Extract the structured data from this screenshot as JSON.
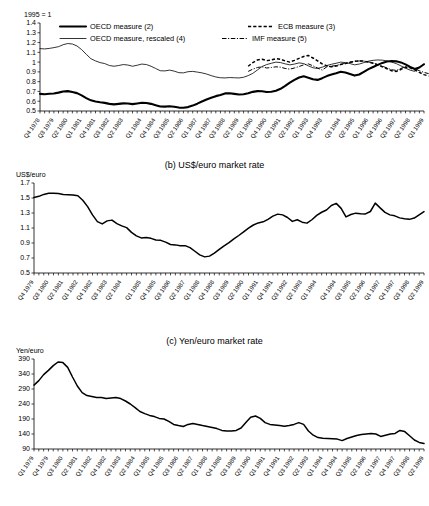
{
  "figure": {
    "panels": [
      {
        "id": "a",
        "title": "",
        "axis_unit": "1995 = 1"
      },
      {
        "id": "b",
        "title": "(b) US$/euro market rate",
        "axis_unit": "US$/euro"
      },
      {
        "id": "c",
        "title": "(c) Yen/euro market rate",
        "axis_unit": "Yen/euro"
      }
    ]
  },
  "chart_data": [
    {
      "panel": "a",
      "type": "line",
      "title": "",
      "xlabel": "",
      "ylabel": "1995 = 1",
      "ylim": [
        0.5,
        1.4
      ],
      "yticks": [
        "0.5",
        "0.6",
        "0.7",
        "0.8",
        "0.9",
        "1",
        "1.1",
        "1.2",
        "1.3",
        "1.4"
      ],
      "grid": false,
      "legend_position": "top",
      "legend": [
        {
          "label": "OECD measure (2)",
          "style": "thick-solid"
        },
        {
          "label": "ECB measure (3)",
          "style": "dashed"
        },
        {
          "label": "OECD measure, rescaled (4)",
          "style": "thin-solid"
        },
        {
          "label": "IMF measure (5)",
          "style": "dash-dot"
        }
      ],
      "x": [
        "Q4 1978",
        "Q1 1979",
        "Q2 1979",
        "Q3 1979",
        "Q4 1979",
        "Q1 1980",
        "Q2 1980",
        "Q3 1980",
        "Q4 1980",
        "Q1 1981",
        "Q2 1981",
        "Q3 1981",
        "Q4 1981",
        "Q1 1982",
        "Q2 1982",
        "Q3 1982",
        "Q4 1982",
        "Q1 1983",
        "Q2 1983",
        "Q3 1983",
        "Q4 1983",
        "Q1 1984",
        "Q2 1984",
        "Q3 1984",
        "Q4 1984",
        "Q1 1985",
        "Q2 1985",
        "Q3 1985",
        "Q4 1985",
        "Q1 1986",
        "Q2 1986",
        "Q3 1986",
        "Q4 1986",
        "Q1 1987",
        "Q2 1987",
        "Q3 1987",
        "Q4 1987",
        "Q1 1988",
        "Q2 1988",
        "Q3 1988",
        "Q4 1988",
        "Q1 1989",
        "Q2 1989",
        "Q3 1989",
        "Q4 1989",
        "Q1 1990",
        "Q2 1990",
        "Q3 1990",
        "Q4 1990",
        "Q1 1991",
        "Q2 1991",
        "Q3 1991",
        "Q4 1991",
        "Q1 1992",
        "Q2 1992",
        "Q3 1992",
        "Q4 1992",
        "Q1 1993",
        "Q2 1993",
        "Q3 1993",
        "Q4 1993",
        "Q1 1994",
        "Q2 1994",
        "Q3 1994",
        "Q4 1994",
        "Q1 1995",
        "Q2 1995",
        "Q3 1995",
        "Q4 1995",
        "Q1 1996",
        "Q2 1996",
        "Q3 1996",
        "Q4 1996",
        "Q1 1997",
        "Q2 1997",
        "Q3 1997",
        "Q4 1997",
        "Q1 1998",
        "Q2 1998",
        "Q3 1998",
        "Q4 1998",
        "Q1 1999",
        "Q2 1999",
        "Q3 1999"
      ],
      "xtick_labels": [
        "Q4 1978",
        "Q3 1979",
        "Q2 1980",
        "Q1 1981",
        "Q4 1981",
        "Q3 1982",
        "Q2 1983",
        "Q1 1984",
        "Q4 1984",
        "Q3 1985",
        "Q2 1986",
        "Q1 1987",
        "Q4 1987",
        "Q3 1988",
        "Q2 1989",
        "Q1 1990",
        "Q4 1990",
        "Q3 1991",
        "Q2 1992",
        "Q1 1993",
        "Q4 1993",
        "Q3 1994",
        "Q2 1995",
        "Q1 1996",
        "Q4 1996",
        "Q3 1997",
        "Q2 1998",
        "Q1 1999"
      ],
      "series": [
        {
          "name": "OECD measure (2)",
          "style": "thick-solid",
          "values": [
            0.675,
            0.672,
            0.676,
            0.679,
            0.688,
            0.7,
            0.703,
            0.694,
            0.683,
            0.66,
            0.632,
            0.609,
            0.597,
            0.589,
            0.583,
            0.573,
            0.568,
            0.573,
            0.578,
            0.576,
            0.57,
            0.577,
            0.585,
            0.582,
            0.573,
            0.559,
            0.546,
            0.545,
            0.549,
            0.543,
            0.535,
            0.534,
            0.54,
            0.555,
            0.575,
            0.597,
            0.617,
            0.636,
            0.652,
            0.664,
            0.68,
            0.682,
            0.675,
            0.668,
            0.672,
            0.682,
            0.696,
            0.703,
            0.702,
            0.695,
            0.697,
            0.707,
            0.727,
            0.757,
            0.79,
            0.818,
            0.843,
            0.855,
            0.841,
            0.825,
            0.818,
            0.836,
            0.857,
            0.873,
            0.886,
            0.901,
            0.893,
            0.878,
            0.862,
            0.873,
            0.9,
            0.928,
            0.95,
            0.972,
            0.992,
            1.006,
            1.012,
            1.008,
            0.997,
            0.977,
            0.951,
            0.93,
            0.945,
            0.978
          ]
        },
        {
          "name": "OECD measure, rescaled (4)",
          "style": "thin-solid",
          "values": [
            1.135,
            1.133,
            1.138,
            1.144,
            1.152,
            1.17,
            1.186,
            1.182,
            1.16,
            1.122,
            1.08,
            1.042,
            1.02,
            1.004,
            0.993,
            0.975,
            0.967,
            0.973,
            0.982,
            0.978,
            0.966,
            0.978,
            0.99,
            0.985,
            0.969,
            0.946,
            0.925,
            0.924,
            0.93,
            0.92,
            0.906,
            0.904,
            0.915,
            0.94,
            0.973,
            1.01,
            1.043,
            1.076,
            1.103,
            1.123,
            1.15,
            1.154,
            1.142,
            1.13,
            1.137,
            1.153,
            1.177,
            1.189,
            1.188,
            1.176,
            1.18,
            1.197,
            1.23,
            1.281,
            1.337,
            1.385,
            1.427,
            1.447,
            1.423,
            1.396,
            1.385,
            1.415,
            1.45,
            1.478,
            1.5,
            1.525,
            1.511,
            1.486,
            1.459,
            1.478,
            1.524,
            1.571,
            1.608,
            1.645,
            1.679,
            1.703,
            1.713,
            1.706,
            1.688,
            1.654,
            1.61,
            1.574,
            1.599,
            1.655
          ],
          "y_display_note": "plotted on same axis as OECD measure but scaled so 1995 = 1; displayed between 0.80 and 1.20 over 1979-1999",
          "display_values": [
            1.138,
            1.135,
            1.14,
            1.148,
            1.158,
            1.178,
            1.19,
            1.185,
            1.165,
            1.128,
            1.08,
            1.035,
            1.012,
            0.995,
            0.985,
            0.965,
            0.958,
            0.965,
            0.975,
            0.97,
            0.958,
            0.968,
            0.98,
            0.975,
            0.958,
            0.935,
            0.912,
            0.91,
            0.918,
            0.908,
            0.892,
            0.89,
            0.902,
            0.905,
            0.898,
            0.89,
            0.878,
            0.862,
            0.848,
            0.84,
            0.838,
            0.842,
            0.84,
            0.838,
            0.845,
            0.862,
            0.885,
            0.92,
            0.955,
            0.975,
            0.988,
            1.0,
            0.995,
            0.982,
            0.972,
            0.98,
            0.992,
            0.985,
            0.962,
            0.942,
            0.935,
            0.948,
            0.965,
            0.978,
            0.988,
            1.0,
            0.995,
            0.985,
            0.972,
            0.98,
            0.995,
            1.01,
            1.018,
            1.022,
            1.02,
            1.012,
            1.0,
            0.985,
            0.962,
            0.938,
            0.918,
            0.905,
            0.948,
            0.982
          ]
        },
        {
          "name": "ECB measure (3)",
          "style": "dashed",
          "start_index": 45,
          "values": [
            0.958,
            0.995,
            1.022,
            1.03,
            1.015,
            1.022,
            1.035,
            1.03,
            1.012,
            1.0,
            1.018,
            1.038,
            1.058,
            1.068,
            1.042,
            1.012,
            0.982,
            0.962,
            0.952,
            0.96,
            0.975,
            0.985,
            0.998,
            1.008,
            1.012,
            1.01,
            1.0,
            0.988,
            0.972,
            0.952,
            0.932,
            0.912,
            0.905,
            0.925,
            0.948,
            0.942,
            0.92,
            0.895,
            0.872,
            0.858
          ]
        },
        {
          "name": "IMF measure (5)",
          "style": "dash-dot",
          "start_index": 45,
          "values": [
            0.905,
            0.928,
            0.945,
            0.952,
            0.94,
            0.945,
            0.952,
            0.948,
            0.935,
            0.928,
            0.94,
            0.955,
            0.972,
            0.982,
            0.962,
            0.94,
            0.918,
            0.952,
            0.958,
            0.965,
            0.978,
            0.988,
            0.998,
            1.008,
            1.012,
            1.01,
            1.002,
            0.99,
            0.975,
            0.958,
            0.94,
            0.922,
            0.915,
            0.935,
            0.955,
            0.95,
            0.932,
            0.912,
            0.895,
            0.882
          ]
        }
      ]
    },
    {
      "panel": "b",
      "type": "line",
      "title": "(b) US$/euro market rate",
      "xlabel": "",
      "ylabel": "US$/euro",
      "ylim": [
        0.5,
        1.7
      ],
      "yticks": [
        "0.5",
        "0.7",
        "0.9",
        "1.1",
        "1.3",
        "1.5",
        "1.7"
      ],
      "grid": false,
      "legend_position": "none",
      "x": [
        "Q4 1979",
        "Q1 1980",
        "Q2 1980",
        "Q3 1980",
        "Q4 1980",
        "Q1 1981",
        "Q2 1981",
        "Q3 1981",
        "Q4 1981",
        "Q1 1982",
        "Q2 1982",
        "Q3 1982",
        "Q4 1982",
        "Q1 1983",
        "Q2 1983",
        "Q3 1983",
        "Q4 1983",
        "Q1 1984",
        "Q2 1984",
        "Q3 1984",
        "Q4 1984",
        "Q1 1985",
        "Q2 1985",
        "Q3 1985",
        "Q4 1985",
        "Q1 1986",
        "Q2 1986",
        "Q3 1986",
        "Q4 1986",
        "Q1 1987",
        "Q2 1987",
        "Q3 1987",
        "Q4 1987",
        "Q1 1988",
        "Q2 1988",
        "Q3 1988",
        "Q4 1988",
        "Q1 1989",
        "Q2 1989",
        "Q3 1989",
        "Q4 1989",
        "Q1 1990",
        "Q2 1990",
        "Q3 1990",
        "Q4 1990",
        "Q1 1991",
        "Q2 1991",
        "Q3 1991",
        "Q4 1991",
        "Q1 1992",
        "Q2 1992",
        "Q3 1992",
        "Q4 1992",
        "Q1 1993",
        "Q2 1993",
        "Q3 1993",
        "Q4 1993",
        "Q1 1994",
        "Q2 1994",
        "Q3 1994",
        "Q4 1994",
        "Q1 1995",
        "Q2 1995",
        "Q3 1995",
        "Q4 1995",
        "Q1 1996",
        "Q2 1996",
        "Q3 1996",
        "Q4 1996",
        "Q1 1997",
        "Q2 1997",
        "Q3 1997",
        "Q4 1997",
        "Q1 1998",
        "Q2 1998",
        "Q3 1998",
        "Q4 1998",
        "Q1 1999",
        "Q2 1999",
        "Q3 1999",
        "Q4 1999"
      ],
      "xtick_labels": [
        "Q4 1979",
        "Q3 1980",
        "Q2 1981",
        "Q1 1982",
        "Q4 1982",
        "Q3 1983",
        "Q2 1984",
        "Q1 1985",
        "Q4 1985",
        "Q3 1986",
        "Q2 1987",
        "Q1 1988",
        "Q4 1988",
        "Q3 1989",
        "Q2 1990",
        "Q1 1991",
        "Q4 1991",
        "Q3 1992",
        "Q2 1993",
        "Q1 1994",
        "Q4 1994",
        "Q3 1995",
        "Q2 1996",
        "Q1 1997",
        "Q4 1997",
        "Q3 1998",
        "Q2 1999"
      ],
      "series": [
        {
          "name": "US$/euro market rate",
          "style": "solid",
          "values": [
            1.508,
            1.522,
            1.548,
            1.562,
            1.565,
            1.56,
            1.548,
            1.545,
            1.54,
            1.53,
            1.47,
            1.385,
            1.275,
            1.185,
            1.155,
            1.195,
            1.205,
            1.158,
            1.128,
            1.105,
            1.042,
            0.995,
            0.968,
            0.972,
            0.962,
            0.94,
            0.935,
            0.912,
            0.88,
            0.875,
            0.862,
            0.865,
            0.838,
            0.79,
            0.742,
            0.715,
            0.725,
            0.765,
            0.815,
            0.862,
            0.905,
            0.955,
            1.0,
            1.048,
            1.098,
            1.14,
            1.168,
            1.182,
            1.215,
            1.258,
            1.285,
            1.275,
            1.24,
            1.188,
            1.21,
            1.178,
            1.165,
            1.21,
            1.268,
            1.31,
            1.34,
            1.4,
            1.428,
            1.362,
            1.248,
            1.28,
            1.298,
            1.29,
            1.288,
            1.32,
            1.432,
            1.368,
            1.308,
            1.275,
            1.262,
            1.235,
            1.222,
            1.215,
            1.232,
            1.275,
            1.318
          ]
        }
      ]
    },
    {
      "panel": "c",
      "type": "line",
      "title": "(c) Yen/euro market rate",
      "xlabel": "",
      "ylabel": "Yen/euro",
      "ylim": [
        90,
        390
      ],
      "yticks": [
        "90",
        "140",
        "190",
        "240",
        "290",
        "340",
        "390"
      ],
      "grid": false,
      "legend_position": "none",
      "x": [
        "Q1 1979",
        "Q2 1979",
        "Q3 1979",
        "Q4 1979",
        "Q1 1980",
        "Q2 1980",
        "Q3 1980",
        "Q4 1980",
        "Q1 1981",
        "Q2 1981",
        "Q3 1981",
        "Q4 1981",
        "Q1 1982",
        "Q2 1982",
        "Q3 1982",
        "Q4 1982",
        "Q1 1983",
        "Q2 1983",
        "Q3 1983",
        "Q4 1983",
        "Q1 1984",
        "Q2 1984",
        "Q3 1984",
        "Q4 1984",
        "Q1 1985",
        "Q2 1985",
        "Q3 1985",
        "Q4 1985",
        "Q1 1986",
        "Q2 1986",
        "Q3 1986",
        "Q4 1986",
        "Q1 1987",
        "Q2 1987",
        "Q3 1987",
        "Q4 1987",
        "Q1 1988",
        "Q2 1988",
        "Q3 1988",
        "Q4 1988",
        "Q1 1989",
        "Q2 1989",
        "Q3 1989",
        "Q4 1989",
        "Q1 1990",
        "Q2 1990",
        "Q3 1990",
        "Q4 1990",
        "Q1 1991",
        "Q2 1991",
        "Q3 1991",
        "Q4 1991",
        "Q1 1992",
        "Q2 1992",
        "Q3 1992",
        "Q4 1992",
        "Q1 1993",
        "Q2 1993",
        "Q3 1993",
        "Q4 1993",
        "Q1 1994",
        "Q2 1994",
        "Q3 1994",
        "Q4 1994",
        "Q1 1995",
        "Q2 1995",
        "Q3 1995",
        "Q4 1995",
        "Q1 1996",
        "Q2 1996",
        "Q3 1996",
        "Q4 1996",
        "Q1 1997",
        "Q2 1997",
        "Q3 1997",
        "Q4 1997",
        "Q1 1998",
        "Q2 1998",
        "Q3 1998",
        "Q4 1998",
        "Q1 1999",
        "Q2 1999"
      ],
      "xtick_labels": [
        "Q1 1979",
        "Q4 1979",
        "Q3 1980",
        "Q2 1981",
        "Q1 1982",
        "Q4 1982",
        "Q3 1983",
        "Q2 1984",
        "Q1 1985",
        "Q4 1985",
        "Q3 1986",
        "Q2 1987",
        "Q1 1988",
        "Q4 1988",
        "Q3 1989",
        "Q2 1990",
        "Q1 1991",
        "Q4 1991",
        "Q3 1992",
        "Q2 1993",
        "Q1 1994",
        "Q4 1994",
        "Q3 1995",
        "Q2 1996",
        "Q1 1997",
        "Q4 1997",
        "Q3 1998",
        "Q2 1999"
      ],
      "series": [
        {
          "name": "Yen/euro market rate",
          "style": "solid",
          "values": [
            303,
            318,
            338,
            352,
            368,
            380,
            378,
            362,
            330,
            300,
            278,
            268,
            265,
            262,
            262,
            258,
            260,
            262,
            258,
            250,
            240,
            228,
            215,
            208,
            202,
            198,
            192,
            190,
            182,
            172,
            168,
            165,
            172,
            175,
            172,
            168,
            165,
            162,
            158,
            152,
            150,
            150,
            152,
            160,
            178,
            196,
            200,
            192,
            178,
            172,
            170,
            168,
            166,
            168,
            172,
            178,
            172,
            150,
            136,
            128,
            126,
            125,
            124,
            123,
            118,
            125,
            130,
            135,
            138,
            140,
            142,
            140,
            132,
            136,
            140,
            142,
            152,
            148,
            134,
            120,
            112,
            108
          ]
        }
      ]
    }
  ]
}
